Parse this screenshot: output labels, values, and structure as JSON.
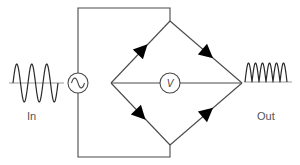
{
  "diagram": {
    "labels": {
      "input": "In",
      "output": "Out",
      "meter": "V"
    },
    "components": {
      "source": {
        "type": "ac-source",
        "symbol": "~"
      },
      "meter": {
        "type": "voltmeter",
        "symbol": "V"
      },
      "diodes": [
        {
          "position": "upper-left",
          "direction": "toward-top-vertex"
        },
        {
          "position": "upper-right",
          "direction": "toward-right-vertex"
        },
        {
          "position": "lower-left",
          "direction": "toward-bottom-vertex"
        },
        {
          "position": "lower-right",
          "direction": "toward-right-vertex"
        }
      ]
    },
    "waveforms": {
      "input": {
        "type": "sine",
        "cycles": 3
      },
      "output": {
        "type": "full-wave-rectified",
        "humps": 6
      }
    },
    "colors": {
      "wire": "#4a4a4a",
      "diode": "#000000",
      "baseline": "#9a9a9a",
      "text": "#555555"
    }
  }
}
